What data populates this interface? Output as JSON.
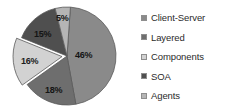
{
  "chart_data": {
    "type": "pie",
    "title": "",
    "subtitle": "",
    "xlabel": "",
    "ylabel": "",
    "grid": false,
    "legend_position": "right",
    "categories": [
      "Client-Server",
      "Layered",
      "Components",
      "SOA",
      "Agents"
    ],
    "values": [
      46,
      18,
      16,
      15,
      5
    ],
    "value_labels": [
      "46%",
      "18%",
      "16%",
      "15%",
      "5%"
    ],
    "units": "percent",
    "total": 100,
    "exploded_slices": [
      "Components"
    ],
    "slice_colors": [
      "#8a8a8a",
      "#6e6e6e",
      "#d2d2d2",
      "#4f4f4f",
      "#b5b5b5"
    ],
    "slice_edge_color": "#5a5a5a",
    "label_text_color": "#1d1d1d",
    "background_color": "#ffffff",
    "slices": [
      {
        "label": "Client-Server",
        "value": 46,
        "display": "46%",
        "color": "#8a8a8a",
        "exploded": false
      },
      {
        "label": "Layered",
        "value": 18,
        "display": "18%",
        "color": "#6e6e6e",
        "exploded": false
      },
      {
        "label": "Components",
        "value": 16,
        "display": "16%",
        "color": "#d2d2d2",
        "exploded": true
      },
      {
        "label": "SOA",
        "value": 15,
        "display": "15%",
        "color": "#4f4f4f",
        "exploded": false
      },
      {
        "label": "Agents",
        "value": 5,
        "display": "5%",
        "color": "#b5b5b5",
        "exploded": false
      }
    ]
  },
  "legend": {
    "items": [
      {
        "label": "Client-Server",
        "color": "#8a8a8a",
        "marker": "square-swatch-icon"
      },
      {
        "label": "Layered",
        "color": "#6e6e6e",
        "marker": "square-swatch-icon"
      },
      {
        "label": "Components",
        "color": "#d2d2d2",
        "marker": "square-swatch-icon"
      },
      {
        "label": "SOA",
        "color": "#4f4f4f",
        "marker": "square-swatch-icon"
      },
      {
        "label": "Agents",
        "color": "#b5b5b5",
        "marker": "square-swatch-icon"
      }
    ]
  }
}
